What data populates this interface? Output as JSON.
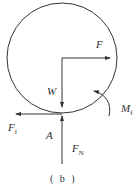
{
  "diagram": {
    "caption": "( b )",
    "labels": {
      "F": "F",
      "W": "W",
      "Ff_main": "F",
      "Ff_sub": "f",
      "A": "A",
      "FN_main": "F",
      "FN_sub": "N",
      "Mf_main": "M",
      "Mf_sub": "f"
    },
    "colors": {
      "stroke": "#333333",
      "background": "#ffffff"
    }
  }
}
